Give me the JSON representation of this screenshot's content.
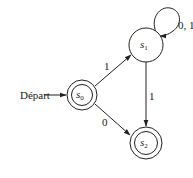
{
  "diagram": {
    "type": "finite-state-automaton",
    "start_label": "Départ",
    "start_state": "s0",
    "states": [
      {
        "id": "s0",
        "base": "s",
        "sub": "0",
        "accepting": true
      },
      {
        "id": "s1",
        "base": "s",
        "sub": "1",
        "accepting": false
      },
      {
        "id": "s2",
        "base": "s",
        "sub": "2",
        "accepting": true
      }
    ],
    "transitions": [
      {
        "from": "s0",
        "to": "s1",
        "label": "1"
      },
      {
        "from": "s0",
        "to": "s2",
        "label": "0"
      },
      {
        "from": "s1",
        "to": "s1",
        "label": "0, 1"
      },
      {
        "from": "s1",
        "to": "s2",
        "label": "1"
      }
    ]
  }
}
